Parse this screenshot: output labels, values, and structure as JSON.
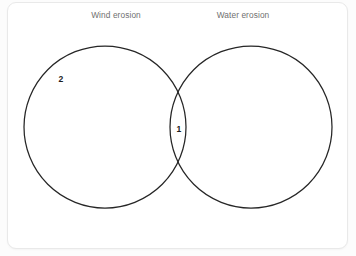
{
  "diagram": {
    "type": "venn",
    "title": "",
    "background_color": "#ffffff",
    "stroke_color": "#262626",
    "label_color": "#6f6f6f",
    "count_color": "#1d1d1d",
    "sets": [
      {
        "id": "wind",
        "label": "Wind erosion",
        "circle": {
          "cx": 105,
          "cy": 127,
          "r": 81
        },
        "only_count": "2"
      },
      {
        "id": "water",
        "label": "Water erosion",
        "circle": {
          "cx": 251,
          "cy": 127,
          "r": 81
        },
        "only_count": ""
      }
    ],
    "intersection": {
      "label": "",
      "count": "1"
    }
  },
  "chart_data": {
    "type": "venn",
    "title": "",
    "categories": [
      "Wind erosion",
      "Water erosion"
    ],
    "regions": [
      {
        "name": "Wind erosion only",
        "value": 2,
        "label": "2"
      },
      {
        "name": "Wind erosion AND Water erosion",
        "value": 1,
        "label": "1"
      },
      {
        "name": "Water erosion only",
        "value": null,
        "label": ""
      }
    ],
    "legend": "none",
    "grid": false
  }
}
